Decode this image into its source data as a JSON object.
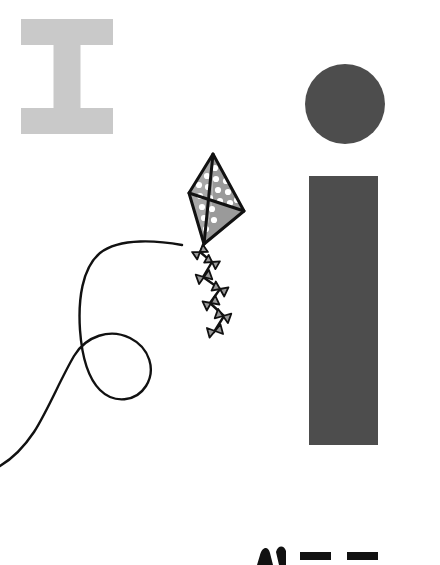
{
  "canvas": {
    "width": 440,
    "height": 565,
    "background_color": "#ffffff",
    "title": "kite-illustration-scene"
  },
  "palette": {
    "light_gray": "#c9c9c9",
    "dark_gray": "#4d4d4d",
    "kite_fill_gray": "#9a9a9a",
    "kite_panel_light": "#a8a8a8",
    "outline_black": "#111111",
    "dot_white": "#ffffff",
    "background_white": "#ffffff"
  },
  "shapes": {
    "letter_i": {
      "label": "I",
      "name": "serif-capital-i",
      "color": "#c9c9c9",
      "x": 21,
      "y": 19,
      "width": 92,
      "height": 115,
      "bar_height": 26,
      "stem_width": 27
    },
    "circle": {
      "name": "dark-circle",
      "color": "#4d4d4d",
      "cx": 345,
      "cy": 104,
      "r": 40
    },
    "rectangle": {
      "name": "dark-vertical-bar",
      "color": "#4d4d4d",
      "x": 309,
      "y": 176,
      "width": 69,
      "height": 269
    }
  },
  "kite": {
    "name": "polka-dot-kite",
    "fill": "#9a9a9a",
    "panel_fill": "#a8a8a8",
    "outline": "#111111",
    "outline_width": 3,
    "dot_color": "#ffffff",
    "dot_radius": 3.1,
    "vertices": {
      "top": [
        213,
        154
      ],
      "left": [
        189,
        193
      ],
      "right": [
        244,
        211
      ],
      "bottom": [
        204,
        244
      ]
    },
    "dots_left_panel": [
      [
        199,
        185
      ],
      [
        207,
        176
      ],
      [
        215,
        168
      ],
      [
        200,
        196
      ],
      [
        208,
        187
      ],
      [
        216,
        179
      ],
      [
        202,
        207
      ],
      [
        210,
        198
      ],
      [
        218,
        190
      ],
      [
        204,
        218
      ],
      [
        212,
        209
      ],
      [
        220,
        201
      ],
      [
        206,
        229
      ],
      [
        214,
        220
      ]
    ],
    "dots_right_panel": [
      [
        224,
        170
      ],
      [
        233,
        178
      ],
      [
        231,
        166
      ],
      [
        226,
        181
      ],
      [
        235,
        189
      ],
      [
        228,
        192
      ],
      [
        237,
        200
      ],
      [
        230,
        203
      ]
    ],
    "tail_segments": [
      {
        "cx": 200,
        "cy": 252,
        "angle": -35,
        "w": 13,
        "h": 9
      },
      {
        "cx": 212,
        "cy": 262,
        "angle": 30,
        "w": 13,
        "h": 9
      },
      {
        "cx": 204,
        "cy": 277,
        "angle": -20,
        "w": 14,
        "h": 10
      },
      {
        "cx": 220,
        "cy": 289,
        "angle": 25,
        "w": 14,
        "h": 10
      },
      {
        "cx": 211,
        "cy": 303,
        "angle": -25,
        "w": 14,
        "h": 10
      },
      {
        "cx": 223,
        "cy": 316,
        "angle": 20,
        "w": 14,
        "h": 10
      },
      {
        "cx": 215,
        "cy": 331,
        "angle": -15,
        "w": 14,
        "h": 10
      }
    ],
    "tail_path": "M 204 244 L 200 252 L 212 262 L 203 277 L 220 289 L 210 303 L 224 316 L 214 332"
  },
  "string": {
    "name": "kite-string",
    "color": "#111111",
    "width": 2.4,
    "path": "M 182 245 C 160 241, 120 237, 100 253 C 82 268, 78 300, 80 330 C 82 358, 88 378, 100 390 C 114 404, 136 402, 146 386 C 156 370, 150 348, 130 338 C 110 328, 86 336, 74 356 C 60 380, 48 410, 34 432 C 22 450, 10 460, 0 466"
  },
  "bottom_glyphs": {
    "name": "cropped-bold-italic-text-row",
    "color": "#111111",
    "note_visible": "tops of clipped bold italic letters at bottom edge",
    "items": [
      {
        "name": "glyph-n-partial",
        "x": 257,
        "y": 546,
        "width": 29,
        "height": 19
      },
      {
        "name": "glyph-bar-1",
        "x": 300,
        "y": 552,
        "width": 31,
        "height": 8
      },
      {
        "name": "glyph-bar-2",
        "x": 347,
        "y": 552,
        "width": 31,
        "height": 8
      }
    ]
  }
}
